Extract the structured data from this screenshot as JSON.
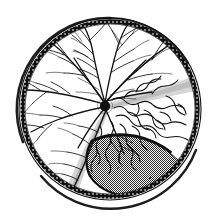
{
  "figure": {
    "view": "right eye fundus, circular field",
    "background_color": "#ffffff",
    "ink_color": "#111111",
    "stipple_color": "#7d7d7d",
    "shade_color": "#c9c9c9",
    "canvas": {
      "width": 218,
      "height": 218
    }
  },
  "globe": {
    "label": "ocular globe outline",
    "center_x": 110,
    "center_y": 109,
    "radius": 91,
    "inner_radius": 86,
    "rim_label": "ora serrata",
    "rim_stroke_width": 2.2,
    "inner_stroke_width": 1.1
  },
  "optic_disc": {
    "label": "optic disc",
    "center_x": 105,
    "center_y": 106,
    "radius": 5.2,
    "fill": "#111111"
  },
  "detachment": {
    "label": "retinal detachment (stippled)",
    "fill": "#7d7d7d",
    "outline": "#111111",
    "outline_width": 2.6,
    "region": "inferotemporal, lens shaped"
  },
  "folds": {
    "label": "retinal folds / wavy demarcation lines",
    "count": 22,
    "stroke": "#111111"
  },
  "vessels": {
    "label": "retinal vessels radiating from optic disc",
    "trunk_count": 12,
    "stroke": "#111111",
    "trunk_width": 1.25,
    "branch_width": 0.75,
    "twig_width": 0.5
  },
  "shaded_bands": {
    "label": "shaded wedge bands from disc",
    "fill": "#c9c9c9",
    "count": 2
  },
  "legend": {
    "visible": false,
    "entries": []
  },
  "annotations": {
    "visible": false,
    "entries": []
  }
}
